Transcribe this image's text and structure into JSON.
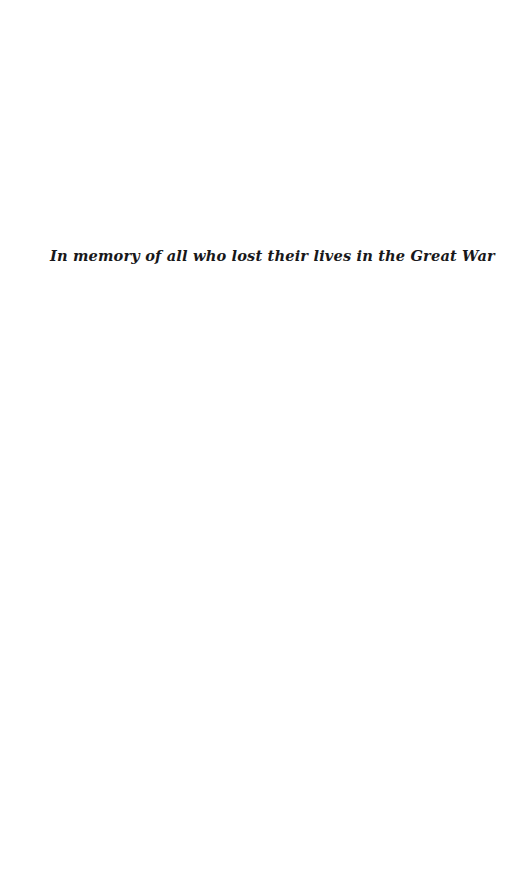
{
  "page": {
    "type": "dedication-page",
    "background_color": "#ffffff",
    "width": 525,
    "height": 886
  },
  "dedication": {
    "text": "In memory of all who lost their lives in the Great War",
    "color": "#18181a",
    "style": "bold-italic-serif",
    "alignment": "left"
  }
}
